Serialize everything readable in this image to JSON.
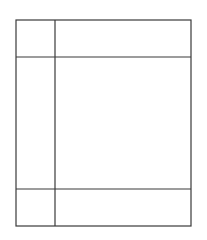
{
  "diagram": {
    "type": "grid-wireframe",
    "canvas": {
      "width": 207,
      "height": 240,
      "background": "#ffffff"
    },
    "stroke_color": "#3a3a3a",
    "outer_frame": {
      "x1": 16,
      "y1": 20,
      "x2": 191,
      "y2": 226
    },
    "vertical_divider_x": 55,
    "horizontal_dividers_y": [
      57,
      189
    ],
    "cells": [
      {
        "row": "header",
        "col": "left"
      },
      {
        "row": "header",
        "col": "right"
      },
      {
        "row": "body",
        "col": "left"
      },
      {
        "row": "body",
        "col": "right"
      },
      {
        "row": "footer",
        "col": "left"
      },
      {
        "row": "footer",
        "col": "right"
      }
    ]
  }
}
